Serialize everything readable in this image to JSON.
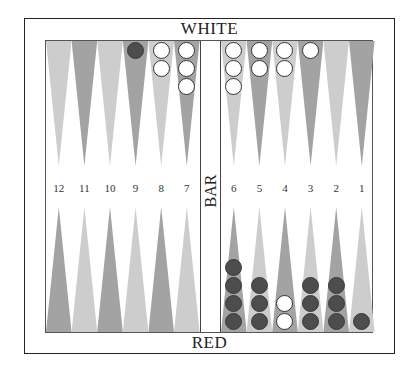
{
  "labels": {
    "top_player": "WHITE",
    "bottom_player": "RED",
    "bar": "BAR"
  },
  "colors": {
    "dark_point": "#a3a3a3",
    "light_point": "#cdcdcd",
    "white_checker": "#ffffff",
    "red_checker": "#4d4d4d"
  },
  "point_numbers_left": [
    "12",
    "11",
    "10",
    "9",
    "8",
    "7"
  ],
  "point_numbers_right": [
    "6",
    "5",
    "4",
    "3",
    "2",
    "1"
  ],
  "top_row": {
    "left": [
      {
        "shade": "light",
        "checkers": []
      },
      {
        "shade": "dark",
        "checkers": []
      },
      {
        "shade": "light",
        "checkers": []
      },
      {
        "shade": "dark",
        "checkers": [
          "red"
        ]
      },
      {
        "shade": "light",
        "checkers": [
          "white",
          "white"
        ]
      },
      {
        "shade": "dark",
        "checkers": [
          "white",
          "white",
          "white"
        ]
      }
    ],
    "right": [
      {
        "shade": "light",
        "checkers": [
          "white",
          "white",
          "white"
        ]
      },
      {
        "shade": "dark",
        "checkers": [
          "white",
          "white"
        ]
      },
      {
        "shade": "light",
        "checkers": [
          "white",
          "white"
        ]
      },
      {
        "shade": "dark",
        "checkers": [
          "white"
        ]
      },
      {
        "shade": "light",
        "checkers": []
      },
      {
        "shade": "dark",
        "checkers": []
      }
    ]
  },
  "bottom_row": {
    "left": [
      {
        "point": 12,
        "shade": "dark",
        "checkers": []
      },
      {
        "point": 11,
        "shade": "light",
        "checkers": []
      },
      {
        "point": 10,
        "shade": "dark",
        "checkers": []
      },
      {
        "point": 9,
        "shade": "light",
        "checkers": []
      },
      {
        "point": 8,
        "shade": "dark",
        "checkers": []
      },
      {
        "point": 7,
        "shade": "light",
        "checkers": []
      }
    ],
    "right": [
      {
        "point": 6,
        "shade": "dark",
        "checkers": [
          "red",
          "red",
          "red",
          "red"
        ]
      },
      {
        "point": 5,
        "shade": "light",
        "checkers": [
          "red",
          "red",
          "red"
        ]
      },
      {
        "point": 4,
        "shade": "dark",
        "checkers": [
          "white",
          "white"
        ]
      },
      {
        "point": 3,
        "shade": "light",
        "checkers": [
          "red",
          "red",
          "red"
        ]
      },
      {
        "point": 2,
        "shade": "dark",
        "checkers": [
          "red",
          "red",
          "red"
        ]
      },
      {
        "point": 1,
        "shade": "light",
        "checkers": [
          "red"
        ]
      }
    ]
  }
}
